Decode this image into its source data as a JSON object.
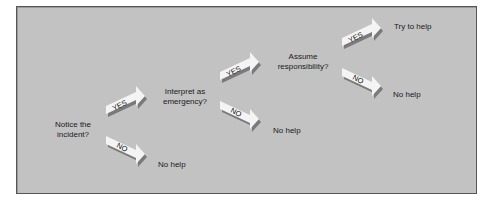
{
  "diagram": {
    "type": "decision-flow",
    "title": "",
    "colors": {
      "background": "#c2c2c2",
      "border": "#555555",
      "arrow_face": "#f4f4f4",
      "arrow_shadow": "#7a7a7a",
      "text": "#1a1a1a"
    },
    "steps": [
      {
        "question": "Notice the incident?",
        "question_lines": [
          "Notice the",
          "incident?"
        ],
        "yes_label": "YES",
        "no_label": "NO",
        "no_outcome": "No help"
      },
      {
        "question": "Interpret as emergency?",
        "question_lines": [
          "Interpret as",
          "emergency?"
        ],
        "yes_label": "YES",
        "no_label": "NO",
        "no_outcome": "No help"
      },
      {
        "question": "Assume responsibility?",
        "question_lines": [
          "Assume",
          "responsibility?"
        ],
        "yes_label": "YES",
        "no_label": "NO",
        "no_outcome": "No help",
        "yes_outcome": "Try to help"
      }
    ]
  }
}
